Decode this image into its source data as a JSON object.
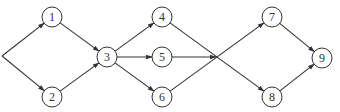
{
  "diagram": {
    "type": "network-flow-graph",
    "colors": {
      "line": "#333333",
      "node_fill": "#ffffff",
      "background": "#ffffff"
    },
    "source_point": {
      "x": 2,
      "y": 56
    },
    "junction_point": {
      "x": 216,
      "y": 57
    },
    "nodes": [
      {
        "id": "1",
        "label": "1",
        "x": 52,
        "y": 17
      },
      {
        "id": "2",
        "label": "2",
        "x": 52,
        "y": 97
      },
      {
        "id": "3",
        "label": "3",
        "x": 107,
        "y": 57
      },
      {
        "id": "4",
        "label": "4",
        "x": 162,
        "y": 17
      },
      {
        "id": "5",
        "label": "5",
        "x": 162,
        "y": 57
      },
      {
        "id": "6",
        "label": "6",
        "x": 162,
        "y": 97
      },
      {
        "id": "7",
        "label": "7",
        "x": 272,
        "y": 17
      },
      {
        "id": "8",
        "label": "8",
        "x": 272,
        "y": 97
      },
      {
        "id": "9",
        "label": "9",
        "x": 322,
        "y": 58
      }
    ],
    "edges": [
      {
        "from": "source",
        "to": "1",
        "arrow": true
      },
      {
        "from": "source",
        "to": "2",
        "arrow": true
      },
      {
        "from": "1",
        "to": "3",
        "arrow": true
      },
      {
        "from": "2",
        "to": "3",
        "arrow": true
      },
      {
        "from": "3",
        "to": "4",
        "arrow": true
      },
      {
        "from": "3",
        "to": "5",
        "arrow": true
      },
      {
        "from": "3",
        "to": "6",
        "arrow": true
      },
      {
        "from": "4",
        "to": "8",
        "arrow": true,
        "via_junction": true
      },
      {
        "from": "5",
        "to": "junction",
        "arrow": true
      },
      {
        "from": "6",
        "to": "7",
        "arrow": true,
        "via_junction": true
      },
      {
        "from": "7",
        "to": "9",
        "arrow": true
      },
      {
        "from": "8",
        "to": "9",
        "arrow": true
      }
    ]
  }
}
